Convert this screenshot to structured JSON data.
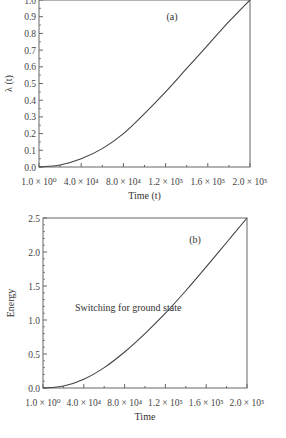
{
  "chart_data": [
    {
      "type": "line",
      "panel_label": "(a)",
      "title": "",
      "xlabel": "Time (t)",
      "ylabel": "λ (t)",
      "xlim": [
        0,
        200000
      ],
      "ylim": [
        0,
        1.0
      ],
      "x_ticks": [
        0,
        40000,
        80000,
        120000,
        160000,
        200000
      ],
      "x_tick_labels": [
        "1.0 × 10⁰",
        "4.0 × 10⁴",
        "8.0 × 10⁴",
        "1.2 × 10⁵",
        "1.6 × 10⁵",
        "2.0 × 10⁵"
      ],
      "y_ticks": [
        0.0,
        0.1,
        0.2,
        0.3,
        0.4,
        0.5,
        0.6,
        0.7,
        0.8,
        0.9,
        1.0
      ],
      "y_tick_labels": [
        "0.0",
        "0.1",
        "0.2",
        "0.3",
        "0.4",
        "0.5",
        "0.6",
        "0.7",
        "0.8",
        "0.9",
        "1.0"
      ],
      "grid": false,
      "x": [
        0,
        20000,
        40000,
        60000,
        80000,
        100000,
        120000,
        140000,
        160000,
        180000,
        200000
      ],
      "series": [
        {
          "name": "λ(t)",
          "values": [
            0.0,
            0.012,
            0.05,
            0.11,
            0.2,
            0.32,
            0.45,
            0.59,
            0.73,
            0.87,
            1.0
          ]
        }
      ]
    },
    {
      "type": "line",
      "panel_label": "(b)",
      "title": "",
      "annotation": "Switching for ground state",
      "xlabel": "Time",
      "ylabel": "Energy",
      "xlim": [
        0,
        200000
      ],
      "ylim": [
        0,
        2.5
      ],
      "x_ticks": [
        0,
        40000,
        80000,
        120000,
        160000,
        200000
      ],
      "x_tick_labels": [
        "1.0 × 10⁰",
        "4.0 × 10⁴",
        "8.0 × 10⁴",
        "1.2 × 10⁵",
        "1.6 × 10⁵",
        "2.0 × 10⁵"
      ],
      "y_ticks": [
        0.0,
        0.5,
        1.0,
        1.5,
        2.0,
        2.5
      ],
      "y_tick_labels": [
        "0.0",
        "0.5",
        "1.0",
        "1.5",
        "2.0",
        "2.5"
      ],
      "grid": false,
      "x": [
        0,
        20000,
        40000,
        60000,
        80000,
        100000,
        120000,
        140000,
        160000,
        180000,
        200000
      ],
      "series": [
        {
          "name": "Energy",
          "values": [
            0.0,
            0.03,
            0.13,
            0.3,
            0.53,
            0.8,
            1.1,
            1.43,
            1.78,
            2.14,
            2.5
          ]
        }
      ]
    }
  ]
}
